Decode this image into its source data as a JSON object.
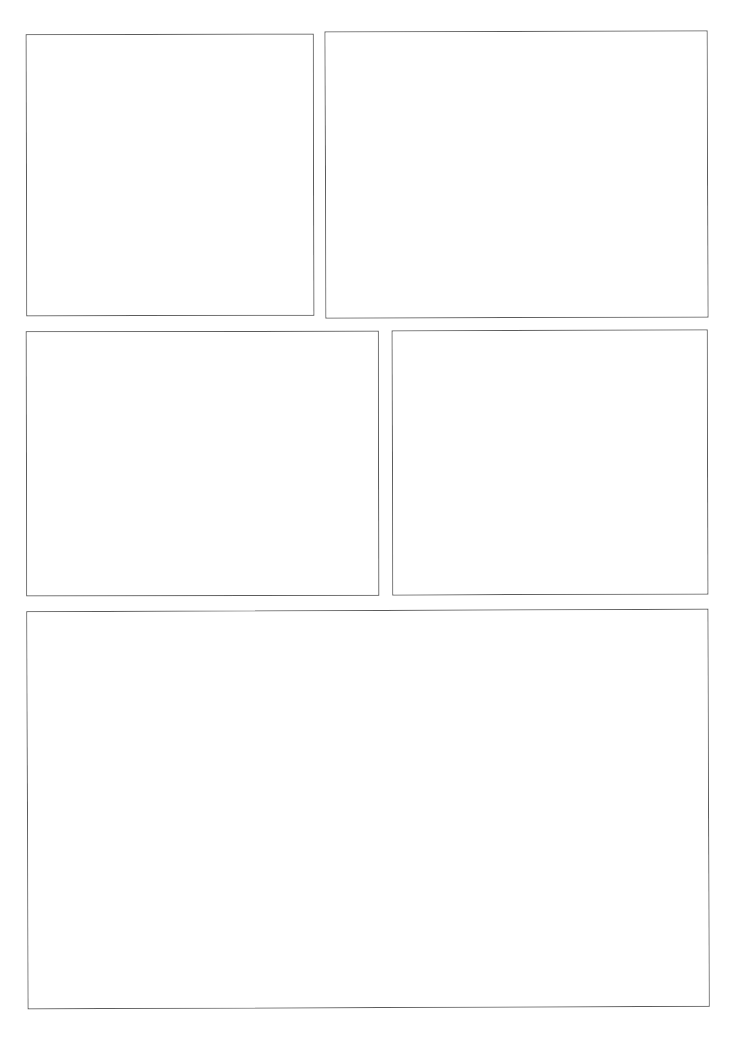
{
  "page": {
    "background_color": "#ffffff",
    "width": 739,
    "height": 1040,
    "border_color": "#5c5c5c",
    "border_width_px": 1,
    "panel_count": 5,
    "row_count": 3,
    "content_text": ""
  },
  "panels": [
    {
      "id": "panel-1",
      "label": "",
      "row": 1,
      "column": 1,
      "x": 26,
      "y": 34,
      "width": 288,
      "height": 282,
      "fill": "#ffffff",
      "stroke": "#5c5c5c",
      "content": ""
    },
    {
      "id": "panel-2",
      "label": "",
      "row": 1,
      "column": 2,
      "x": 325,
      "y": 31,
      "width": 383,
      "height": 287,
      "fill": "#ffffff",
      "stroke": "#5c5c5c",
      "content": ""
    },
    {
      "id": "panel-3",
      "label": "",
      "row": 2,
      "column": 1,
      "x": 26,
      "y": 331,
      "width": 353,
      "height": 265,
      "fill": "#ffffff",
      "stroke": "#5c5c5c",
      "content": ""
    },
    {
      "id": "panel-4",
      "label": "",
      "row": 2,
      "column": 2,
      "x": 392,
      "y": 330,
      "width": 316,
      "height": 265,
      "fill": "#ffffff",
      "stroke": "#5c5c5c",
      "content": ""
    },
    {
      "id": "panel-5",
      "label": "",
      "row": 3,
      "column": 1,
      "x": 27,
      "y": 610,
      "width": 682,
      "height": 398,
      "fill": "#ffffff",
      "stroke": "#5c5c5c",
      "content": ""
    }
  ]
}
